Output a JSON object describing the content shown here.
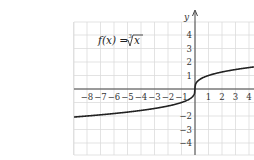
{
  "chart_data": {
    "type": "line",
    "function": "cube root",
    "xlabel": "x",
    "ylabel": "y",
    "xlim": [
      -9,
      4.4
    ],
    "ylim": [
      -4.9,
      5
    ],
    "x_ticks": [
      -8,
      -7,
      -6,
      -5,
      -4,
      -3,
      -2,
      -1,
      1,
      2,
      3,
      4
    ],
    "y_ticks": [
      4,
      3,
      2,
      1,
      -2,
      -3,
      -4
    ],
    "grid": true,
    "series": [
      {
        "name": "f(x) = ∛x",
        "x": [
          -9,
          -8,
          -4,
          -1,
          -0.125,
          0,
          0.125,
          1,
          4.4
        ],
        "y": [
          -2.08,
          -2,
          -1.59,
          -1,
          -0.5,
          0,
          0.5,
          1,
          1.64
        ]
      }
    ]
  },
  "labels": {
    "title_lhs": "f(x) = ",
    "title_root_index": "3",
    "title_radicand": "x",
    "y_axis": "y"
  }
}
